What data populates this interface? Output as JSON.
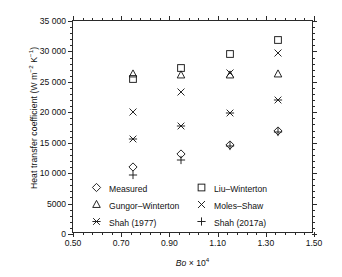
{
  "chart_data": {
    "type": "scatter",
    "title": "",
    "xlabel": "Bo × 10⁴",
    "ylabel": "Heat transfer coefficient (W m⁻² K⁻¹)",
    "xlim": [
      0.5,
      1.5
    ],
    "ylim": [
      0,
      35000
    ],
    "grid": false,
    "legend_position": "inside-bottom",
    "x_ticks": [
      "0.50",
      "0.70",
      "0.90",
      "1.10",
      "1.30",
      "1.50"
    ],
    "x_tick_values": [
      0.5,
      0.7,
      0.9,
      1.1,
      1.3,
      1.5
    ],
    "x_minor_per_interval": 4,
    "y_ticks": [
      "0",
      "5000",
      "10 000",
      "15 000",
      "20 000",
      "25 000",
      "30 000",
      "35 000"
    ],
    "y_tick_values": [
      0,
      5000,
      10000,
      15000,
      20000,
      25000,
      30000,
      35000
    ],
    "y_minor_per_interval": 4,
    "x": [
      0.75,
      0.95,
      1.15,
      1.35
    ],
    "series": [
      {
        "name": "Measured",
        "marker": "diamond",
        "values": [
          11000,
          13100,
          14600,
          16900
        ]
      },
      {
        "name": "Liu–Winterton",
        "marker": "square",
        "values": [
          25400,
          27300,
          29500,
          31800
        ]
      },
      {
        "name": "Gungor–Winterton",
        "marker": "triangle",
        "values": [
          26300,
          26200,
          26200,
          26300
        ]
      },
      {
        "name": "Moles–Shaw",
        "marker": "cross",
        "values": [
          20000,
          23400,
          26500,
          29800
        ]
      },
      {
        "name": "Shah (1977)",
        "marker": "asterisk",
        "values": [
          15600,
          17800,
          19900,
          22100
        ]
      },
      {
        "name": "Shah (2017a)",
        "marker": "plus",
        "values": [
          9700,
          12200,
          14400,
          16700
        ]
      }
    ]
  },
  "legend": {
    "entries": [
      {
        "label": "Measured",
        "marker": "diamond"
      },
      {
        "label": "Liu–Winterton",
        "marker": "square"
      },
      {
        "label": "Gungor–Winterton",
        "marker": "triangle"
      },
      {
        "label": "Moles–Shaw",
        "marker": "cross"
      },
      {
        "label": "Shah (1977)",
        "marker": "asterisk"
      },
      {
        "label": "Shah (2017a)",
        "marker": "plus"
      }
    ],
    "order": [
      "Measured",
      "Liu–Winterton",
      "Gungor–Winterton",
      "Moles–Shaw",
      "Shah (1977)",
      "Shah (2017a)"
    ]
  },
  "style": {
    "axis_color": "#2a2a2a",
    "marker_color": "#1a1a1a",
    "background": "#ffffff"
  }
}
